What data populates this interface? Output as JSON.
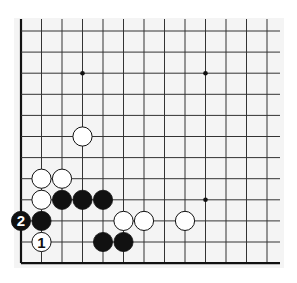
{
  "diagram": {
    "type": "go-board-fragment",
    "corner": "bottom-left",
    "columns": 13,
    "rows": 12,
    "origin_x": 21,
    "origin_y": 31,
    "spacing_x": 20.5,
    "spacing_y": 21.1,
    "open_top": true,
    "open_right": true,
    "colors": {
      "background": "#f4f4f4",
      "line": "#333333",
      "edge": "#111111",
      "black_stone": "#111111",
      "white_stone": "#ffffff"
    },
    "star_points": [
      {
        "col": 3,
        "row": 2
      },
      {
        "col": 9,
        "row": 2
      },
      {
        "col": 9,
        "row": 8
      }
    ],
    "stones": [
      {
        "color": "white",
        "col": 3,
        "row": 5,
        "label": ""
      },
      {
        "color": "white",
        "col": 1,
        "row": 7,
        "label": ""
      },
      {
        "color": "white",
        "col": 2,
        "row": 7,
        "label": ""
      },
      {
        "color": "white",
        "col": 1,
        "row": 8,
        "label": ""
      },
      {
        "color": "black",
        "col": 2,
        "row": 8,
        "label": ""
      },
      {
        "color": "black",
        "col": 3,
        "row": 8,
        "label": ""
      },
      {
        "color": "black",
        "col": 4,
        "row": 8,
        "label": ""
      },
      {
        "color": "black",
        "col": 0,
        "row": 9,
        "label": "2"
      },
      {
        "color": "black",
        "col": 1,
        "row": 9,
        "label": ""
      },
      {
        "color": "white",
        "col": 5,
        "row": 9,
        "label": ""
      },
      {
        "color": "white",
        "col": 6,
        "row": 9,
        "label": ""
      },
      {
        "color": "white",
        "col": 8,
        "row": 9,
        "label": ""
      },
      {
        "color": "white",
        "col": 1,
        "row": 10,
        "label": "1"
      },
      {
        "color": "black",
        "col": 4,
        "row": 10,
        "label": ""
      },
      {
        "color": "black",
        "col": 5,
        "row": 10,
        "label": ""
      }
    ]
  }
}
